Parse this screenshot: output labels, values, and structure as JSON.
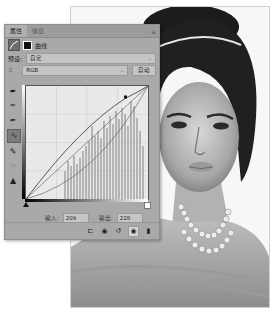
{
  "panel": {
    "tabs": [
      {
        "label": "属性",
        "active": true
      },
      {
        "label": "信息",
        "active": false
      }
    ],
    "menu_icon": "panel-menu-icon",
    "adjustment": {
      "icon": "curves-adjustment-icon",
      "mask_icon": "layer-mask-icon",
      "label": "曲线"
    },
    "preset": {
      "label": "预设:",
      "value": "自定"
    },
    "channel": {
      "icon": "on-image-adjust-icon",
      "value": "RGB",
      "auto_label": "自动"
    },
    "tools": [
      {
        "name": "black-point-eyedropper-icon",
        "glyph": "✒",
        "selected": false,
        "disabled": false
      },
      {
        "name": "gray-point-eyedropper-icon",
        "glyph": "✒",
        "selected": false,
        "disabled": false
      },
      {
        "name": "white-point-eyedropper-icon",
        "glyph": "✒",
        "selected": false,
        "disabled": false
      },
      {
        "name": "edit-points-curve-icon",
        "glyph": "∿",
        "selected": true,
        "disabled": false
      },
      {
        "name": "pencil-draw-icon",
        "glyph": "✎",
        "selected": false,
        "disabled": false
      },
      {
        "name": "smooth-curve-icon",
        "glyph": "≈",
        "selected": false,
        "disabled": true
      },
      {
        "name": "clipping-warning-icon",
        "glyph": "▲",
        "selected": false,
        "disabled": false
      }
    ],
    "curve": {
      "input": 209,
      "output": 228,
      "points": [
        [
          0,
          0
        ],
        [
          209,
          228
        ],
        [
          255,
          255
        ]
      ],
      "baseline_visible": true,
      "histogram": "grayscale-histogram"
    },
    "io": {
      "input_label": "输入:",
      "input_value": "209",
      "output_label": "输出:",
      "output_value": "228"
    },
    "bottom_icons": [
      {
        "name": "clip-to-layer-icon",
        "glyph": "⊏",
        "active": false
      },
      {
        "name": "view-previous-state-icon",
        "glyph": "◉",
        "active": false
      },
      {
        "name": "reset-icon",
        "glyph": "↺",
        "active": false
      },
      {
        "name": "toggle-visibility-icon",
        "glyph": "◉",
        "active": true
      },
      {
        "name": "delete-icon",
        "glyph": "🗑",
        "active": false
      }
    ]
  },
  "photo": {
    "description": "black-and-white portrait of woman with pearl necklace and hair bun"
  }
}
